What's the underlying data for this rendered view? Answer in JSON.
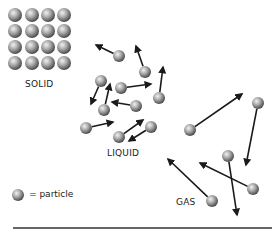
{
  "labels": {
    "solid": "SOLID",
    "liquid": "LIQUID",
    "gas": "GAS",
    "legend": "= particle"
  },
  "colors": {
    "particle_light": "#e6e6e6",
    "particle_mid": "#9a9a9a",
    "particle_dark": "#4a4a4a",
    "arrow": "#1a1a1a",
    "ground_line": "#333333",
    "background": "#ffffff"
  },
  "solid": {
    "columns": [
      15,
      32,
      48,
      64
    ],
    "rows": [
      15,
      31,
      47,
      63
    ],
    "radius": 7
  },
  "liquid": {
    "particles": [
      {
        "x": 119,
        "y": 56,
        "ax": 96,
        "ay": 45
      },
      {
        "x": 145,
        "y": 72,
        "ax": 136,
        "ay": 46
      },
      {
        "x": 101,
        "y": 81,
        "ax": 91,
        "ay": 104
      },
      {
        "x": 121,
        "y": 88,
        "ax": 151,
        "ay": 84
      },
      {
        "x": 159,
        "y": 98,
        "ax": 163,
        "ay": 67
      },
      {
        "x": 104,
        "y": 110,
        "ax": 110,
        "ay": 84
      },
      {
        "x": 136,
        "y": 106,
        "ax": 112,
        "ay": 102
      },
      {
        "x": 86,
        "y": 128,
        "ax": 113,
        "ay": 122
      },
      {
        "x": 119,
        "y": 137,
        "ax": 143,
        "ay": 120
      },
      {
        "x": 151,
        "y": 127,
        "ax": 129,
        "ay": 141
      }
    ],
    "radius": 6
  },
  "gas": {
    "particles": [
      {
        "x": 190,
        "y": 130,
        "ax": 242,
        "ay": 94
      },
      {
        "x": 258,
        "y": 103,
        "ax": 246,
        "ay": 165
      },
      {
        "x": 228,
        "y": 156,
        "ax": 237,
        "ay": 215
      },
      {
        "x": 253,
        "y": 189,
        "ax": 200,
        "ay": 163
      },
      {
        "x": 212,
        "y": 201,
        "ax": 168,
        "ay": 159
      }
    ],
    "radius": 6
  },
  "legend": {
    "particle": {
      "x": 18,
      "y": 195,
      "r": 6
    }
  },
  "ground_line": {
    "x1": 13,
    "x2": 272,
    "y": 228
  }
}
